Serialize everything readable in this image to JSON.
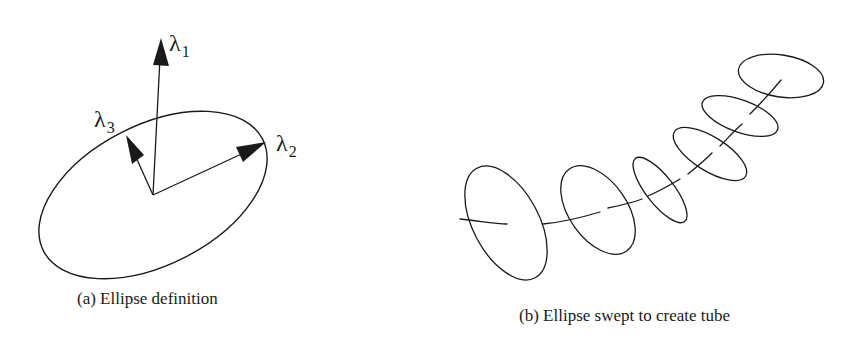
{
  "figure": {
    "panels": [
      {
        "id": "a",
        "caption": "(a) Ellipse definition",
        "ellipse": {
          "cx": 153,
          "cy": 195,
          "rx": 123,
          "ry": 70,
          "rotation_deg": -27
        },
        "vectors": [
          {
            "name": "lambda-1",
            "symbol": "λ",
            "subscript": "1",
            "from": [
              153,
              195
            ],
            "to": [
              161,
              38
            ]
          },
          {
            "name": "lambda-2",
            "symbol": "λ",
            "subscript": "2",
            "from": [
              153,
              195
            ],
            "to": [
              266,
              142
            ]
          },
          {
            "name": "lambda-3",
            "symbol": "λ",
            "subscript": "3",
            "from": [
              153,
              195
            ],
            "to": [
              126,
              135
            ]
          }
        ]
      },
      {
        "id": "b",
        "caption": "(b) Ellipse swept to create tube",
        "ellipses": [
          {
            "cx": 506,
            "cy": 223,
            "rx": 62,
            "ry": 33,
            "rotation_deg": 62
          },
          {
            "cx": 598,
            "cy": 210,
            "rx": 50,
            "ry": 29,
            "rotation_deg": 55
          },
          {
            "cx": 660,
            "cy": 190,
            "rx": 40,
            "ry": 14,
            "rotation_deg": 52
          },
          {
            "cx": 710,
            "cy": 154,
            "rx": 42,
            "ry": 17,
            "rotation_deg": 32
          },
          {
            "cx": 740,
            "cy": 116,
            "rx": 40,
            "ry": 16,
            "rotation_deg": 20
          },
          {
            "cx": 781,
            "cy": 76,
            "rx": 43,
            "ry": 21,
            "rotation_deg": 9
          }
        ]
      }
    ],
    "labels": {
      "lambda_symbol": "λ",
      "sub1": "1",
      "sub2": "2",
      "sub3": "3"
    },
    "colors": {
      "stroke": "#1a1a1a",
      "background": "#ffffff"
    }
  }
}
